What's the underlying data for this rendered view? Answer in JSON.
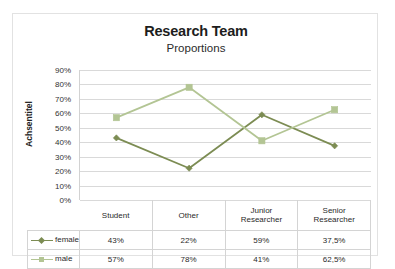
{
  "chart_data": {
    "type": "line",
    "title": "Research Team",
    "subtitle": "Proportions",
    "xlabel": "",
    "ylabel": "Achsentitel",
    "ylim": [
      0,
      90
    ],
    "grid": true,
    "legend_position": "data-table-left",
    "categories": [
      "Student",
      "Other",
      "Junior Researcher",
      "Senior Researcher"
    ],
    "category_lines": [
      [
        "Student"
      ],
      [
        "Other"
      ],
      [
        "Junior",
        "Researcher"
      ],
      [
        "Senior",
        "Researcher"
      ]
    ],
    "ytick_labels": [
      "90%",
      "80%",
      "70%",
      "60%",
      "50%",
      "40%",
      "30%",
      "20%",
      "10%",
      "0%"
    ],
    "ytick_values": [
      90,
      80,
      70,
      60,
      50,
      40,
      30,
      20,
      10,
      0
    ],
    "series": [
      {
        "name": "female",
        "values": [
          43,
          22,
          59,
          37.5
        ],
        "labels": [
          "43%",
          "22%",
          "59%",
          "37,5%"
        ],
        "color": "#7c8c53",
        "marker": "diamond"
      },
      {
        "name": "male",
        "values": [
          57,
          78,
          41,
          62.5
        ],
        "labels": [
          "57%",
          "78%",
          "41%",
          "62,5%"
        ],
        "color": "#b3c594",
        "marker": "square"
      }
    ]
  },
  "colors": {
    "female": "#7c8c53",
    "male": "#b3c594",
    "gridline": "#d9d9d9",
    "border": "#e2e2e2",
    "table_border": "#d4d4d4"
  }
}
